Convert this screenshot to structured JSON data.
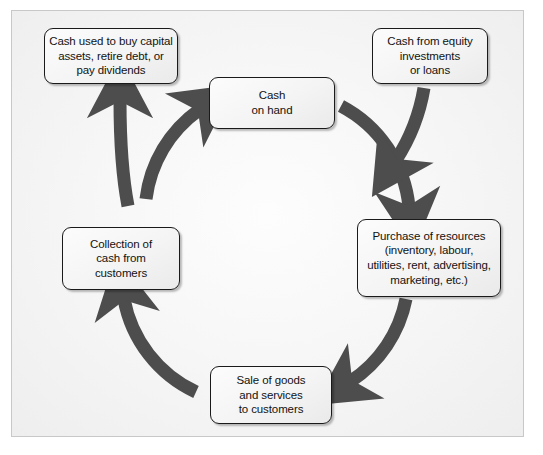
{
  "diagram": {
    "type": "cash-flow-cycle",
    "colors": {
      "arrow": "#4d4d4d",
      "box_border": "#1a1a1a",
      "box_fill": "#f5f5f5",
      "canvas": "#f4f4f4",
      "frame_border": "#c8c8c8",
      "text": "#121212"
    },
    "nodes": [
      {
        "id": "capital",
        "name": "cash-used-box",
        "lines": [
          "Cash used to buy capital",
          "assets, retire debt, or",
          "pay dividends"
        ]
      },
      {
        "id": "equity",
        "name": "cash-from-equity-box",
        "lines": [
          "Cash from equity",
          "investments",
          "or loans"
        ]
      },
      {
        "id": "cash",
        "name": "cash-on-hand-box",
        "lines": [
          "Cash",
          "on hand"
        ]
      },
      {
        "id": "purchase",
        "name": "purchase-of-resources-box",
        "lines": [
          "Purchase of resources",
          "(inventory, labour,",
          "utilities, rent, advertising,",
          "marketing, etc.)"
        ]
      },
      {
        "id": "sale",
        "name": "sale-of-goods-box",
        "lines": [
          "Sale of goods",
          "and services",
          "to customers"
        ]
      },
      {
        "id": "collect",
        "name": "collection-of-cash-box",
        "lines": [
          "Collection of",
          "cash from",
          "customers"
        ]
      }
    ],
    "arrows": [
      {
        "id": "cash-to-purchase",
        "from": "cash",
        "to": "purchase",
        "shape": "curve-right-down"
      },
      {
        "id": "purchase-to-sale",
        "from": "purchase",
        "to": "sale",
        "shape": "curve-down-left"
      },
      {
        "id": "sale-to-collect",
        "from": "sale",
        "to": "collect",
        "shape": "curve-left-up"
      },
      {
        "id": "collect-to-cash",
        "from": "collect",
        "to": "cash",
        "shape": "curve-up-right"
      },
      {
        "id": "collect-to-capital",
        "from": "collect",
        "to": "capital",
        "shape": "branch-up"
      },
      {
        "id": "equity-to-cycle",
        "from": "equity",
        "to": "cycle",
        "shape": "down-into-circle"
      }
    ]
  }
}
